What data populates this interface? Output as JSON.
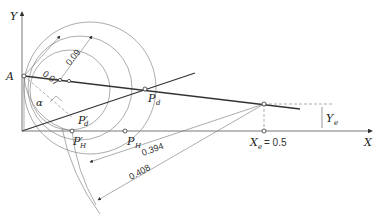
{
  "axes": {
    "x_label": "X",
    "y_label": "Y"
  },
  "points": {
    "A": "A",
    "alpha": "α",
    "P_d": "P",
    "P_d_sub": "d",
    "P_d_prime": "P",
    "P_d_prime_sub": "d",
    "P_H": "P",
    "P_H_sub": "H",
    "P_H_prime": "P",
    "P_H_prime_sub": "H",
    "X_e": "X",
    "X_e_sub": "e",
    "X_e_value": "= 0.5",
    "Y_e": "Y",
    "Y_e_sub": "e"
  },
  "dimensions": {
    "r1": "0.07",
    "r2": "0.09",
    "d1": "0.394",
    "d2": "0.408"
  },
  "colors": {
    "line": "#333333",
    "thin": "#666666",
    "arc": "#888888"
  }
}
